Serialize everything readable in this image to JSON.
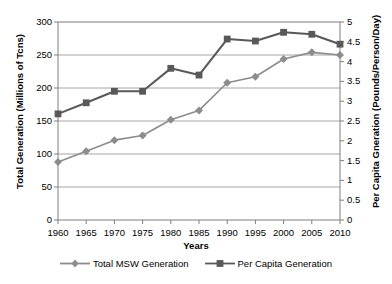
{
  "chart_data": {
    "type": "line",
    "title": "",
    "xlabel": "Years",
    "ylabel": "Total Generation (Millions of Tcns)",
    "y2label": "Per Capita Gneration (Pounds/Person/Day)",
    "categories": [
      1960,
      1965,
      1970,
      1975,
      1980,
      1985,
      1990,
      1995,
      2000,
      2005,
      2010
    ],
    "x_tick_labels": [
      "1960",
      "1965",
      "1970",
      "1975",
      "1980",
      "1985",
      "1990",
      "1995",
      "2000",
      "2005",
      "2010"
    ],
    "ylim": [
      0,
      300
    ],
    "y_ticks": [
      0,
      50,
      100,
      150,
      200,
      250,
      300
    ],
    "y_tick_labels": [
      "0",
      "50",
      "100",
      "150",
      "200",
      "250",
      "300"
    ],
    "y2lim": [
      0,
      5
    ],
    "y2_ticks": [
      0,
      0.5,
      1,
      1.5,
      2,
      2.5,
      3,
      3.5,
      4,
      4.5,
      5
    ],
    "y2_tick_labels": [
      "0",
      "0.5",
      "1",
      "1.5",
      "2",
      "2.5",
      "3",
      "3.5",
      "4",
      "4.5",
      "5"
    ],
    "grid": true,
    "grid_axis": "y-left",
    "legend_position": "bottom",
    "series": [
      {
        "name": "Total MSW Generation",
        "axis": "left",
        "marker": "diamond",
        "color": "#8c8c8c",
        "values": [
          88,
          104,
          121,
          128,
          152,
          166,
          208,
          217,
          244,
          254,
          250
        ]
      },
      {
        "name": "Per Capita Generation",
        "axis": "right",
        "marker": "square",
        "color": "#595959",
        "values": [
          2.68,
          2.96,
          3.25,
          3.25,
          3.83,
          3.66,
          4.57,
          4.52,
          4.74,
          4.69,
          4.44
        ]
      }
    ]
  },
  "legend": {
    "entries": [
      {
        "label": "Total MSW Generation"
      },
      {
        "label": "Per Capita Generation"
      }
    ]
  },
  "colors": {
    "series_total_msw": "#8c8c8c",
    "series_per_capita": "#595959",
    "grid": "#a6a6a6",
    "axis": "#7f7f7f",
    "text": "#000000",
    "background": "#ffffff"
  }
}
